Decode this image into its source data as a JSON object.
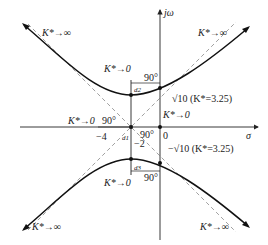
{
  "axes": {
    "x_label": "σ",
    "y_label": "jω",
    "origin_label": "0",
    "tick_minus4": "−4",
    "tick_minus2": "−2"
  },
  "labels": {
    "k_to_inf_top_left": "K*→∞",
    "k_to_inf_top_right": "K*→∞",
    "k_to_inf_bottom_left": "K*→∞",
    "k_to_inf_bottom_right": "K*→∞",
    "k_to_zero_top": "K*→0",
    "k_to_zero_bottom": "K*→0",
    "k_to_zero_left": "K*→0",
    "k_to_zero_origin": "K*→0",
    "crossing_upper": "√10 (K*=3.25)",
    "crossing_lower": "−√10 (K*=3.25)",
    "angle_90": "90°",
    "d1": "d1",
    "d2": "d2",
    "d3": "d3"
  },
  "caption": ""
}
